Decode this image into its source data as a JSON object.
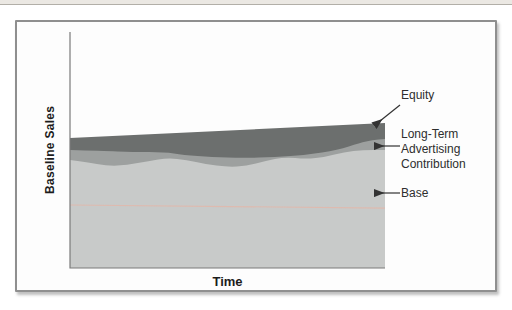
{
  "figure": {
    "frame_border_color": "#8f8f8f",
    "background_color": "#fdfdfd",
    "axis_color": "#7b7b7b",
    "text_color": "#2e2e2e"
  },
  "axes": {
    "y_label": "Baseline Sales",
    "x_label": "Time"
  },
  "annotations": [
    {
      "label": "Equity",
      "arrow": {
        "from": [
          383,
          83
        ],
        "to": [
          358,
          103
        ]
      }
    },
    {
      "lines": [
        "Long-Term",
        "Advertising",
        "Contribution"
      ],
      "arrow": {
        "from": [
          383,
          124
        ],
        "to": [
          358,
          124
        ]
      }
    },
    {
      "label": "Base",
      "arrow": {
        "from": [
          383,
          171
        ],
        "to": [
          358,
          171
        ]
      }
    }
  ],
  "chart_data": {
    "type": "area",
    "title": "",
    "xlabel": "Time",
    "ylabel": "Baseline Sales",
    "x_range": [
      0,
      100
    ],
    "y_range": [
      0,
      100
    ],
    "note": "Schematic stacked-area chart; axes are unlabeled, values are relative (percent of plot height) read from pixel positions.",
    "grid": false,
    "legend_position": "right-annotations",
    "layers": [
      {
        "name": "Base",
        "color": "#c8cac9",
        "t": [
          0,
          5,
          12,
          18,
          25,
          31,
          37,
          43,
          50,
          56,
          62,
          68,
          75,
          81,
          87,
          93,
          100
        ],
        "v": [
          45.8,
          44.9,
          43.2,
          43.6,
          45.3,
          46.6,
          45.8,
          44.1,
          42.8,
          43.2,
          45.3,
          47.0,
          46.2,
          47.0,
          49.2,
          50.0,
          50.0
        ]
      },
      {
        "name": "Long-Term Advertising Contribution",
        "color": "#9da09f",
        "t": [
          0,
          10,
          20,
          30,
          36,
          45,
          55,
          65,
          75,
          85,
          92,
          96,
          100
        ],
        "v": [
          50.0,
          49.6,
          49.2,
          49.2,
          47.9,
          47.0,
          46.6,
          47.0,
          47.9,
          50.0,
          53.0,
          54.2,
          54.7
        ]
      },
      {
        "name": "Equity",
        "color": "#6c6f6e",
        "t": [
          0,
          100
        ],
        "v": [
          55.1,
          61.4
        ]
      }
    ],
    "reference_line": {
      "name": "base reference line",
      "color": "#e2b7aa",
      "t": [
        0,
        100
      ],
      "v": [
        26.7,
        25.4
      ]
    }
  }
}
